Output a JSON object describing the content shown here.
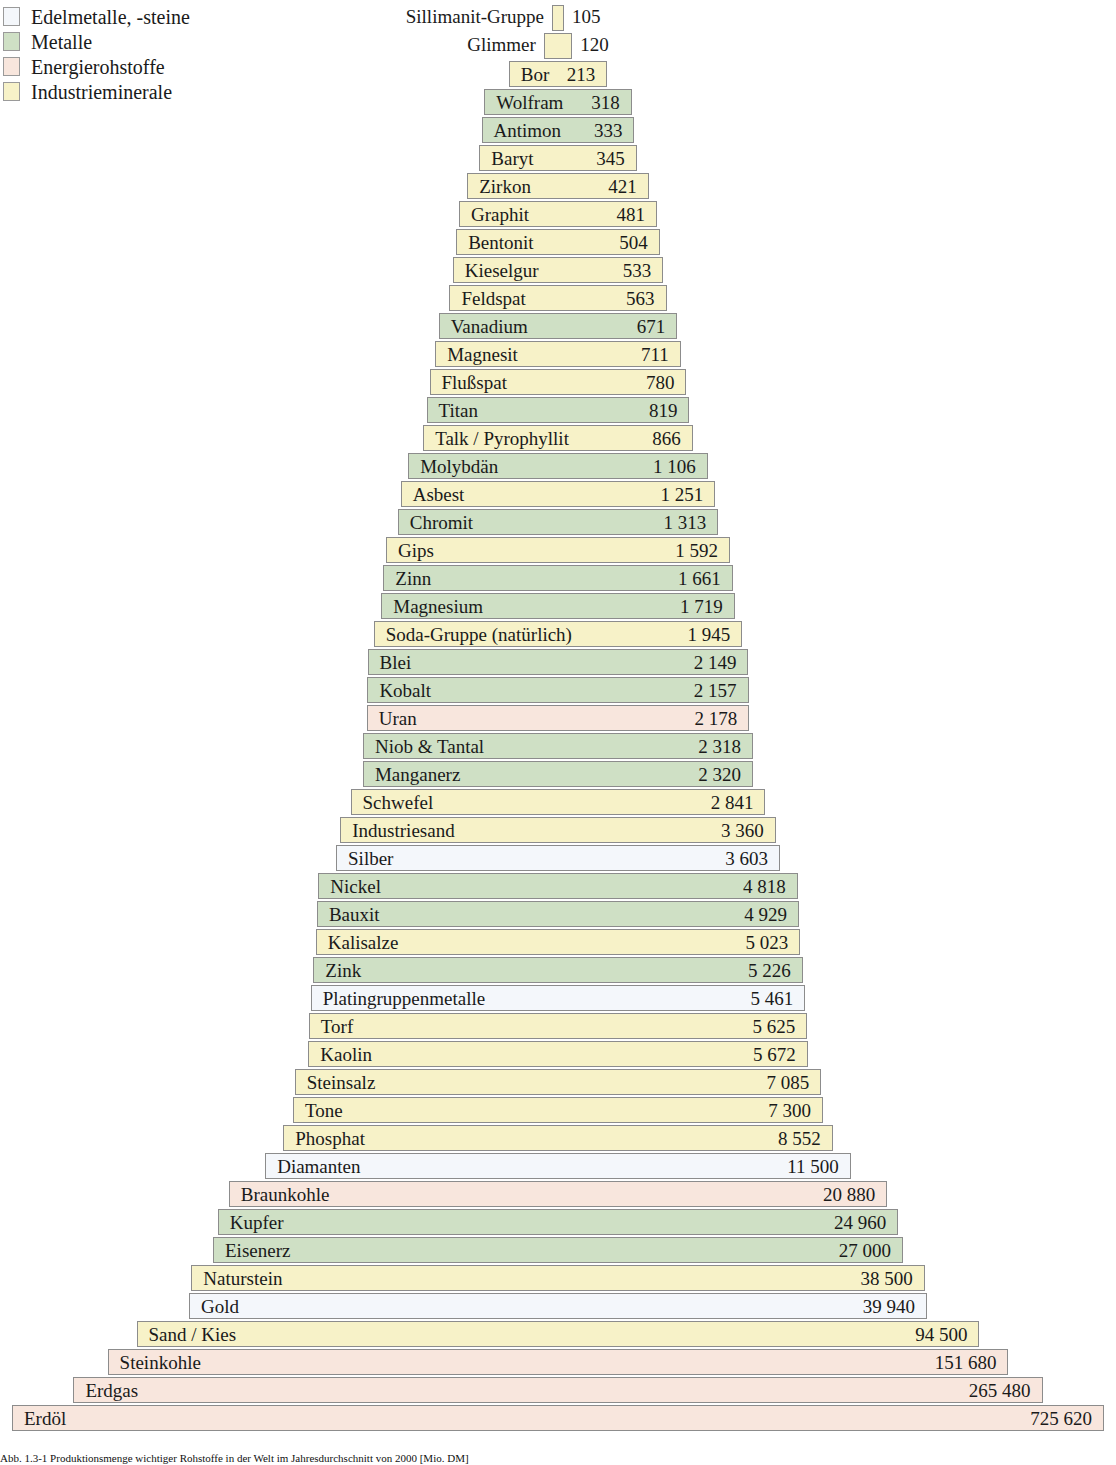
{
  "legend": {
    "items": [
      {
        "label": "Edelmetalle, -steine",
        "key": "edel",
        "color": "#f4f7fb"
      },
      {
        "label": "Metalle",
        "key": "metall",
        "color": "#cfe0c5"
      },
      {
        "label": "Energierohstoffe",
        "key": "energie",
        "color": "#f8e6dd"
      },
      {
        "label": "Industrieminerale",
        "key": "industrie",
        "color": "#f7f2c8"
      }
    ]
  },
  "caption": {
    "text": "Abb. 1.3-1  Produktionsmenge wichtiger Rohstoffe in der Welt im Jahresdurchschnitt von 2000 [Mio. DM]"
  },
  "chart_data": {
    "type": "bar",
    "xlabel": "",
    "ylabel": "",
    "orientation": "pyramid-centered-horizontal",
    "value_unit": "Mio. US-$",
    "grid": false,
    "legend_position": "top-left",
    "categories_legend": [
      "Edelmetalle, -steine",
      "Metalle",
      "Energierohstoffe",
      "Industrieminerale"
    ],
    "rows": [
      {
        "label": "Sillimanit-Gruppe",
        "value": 105,
        "value_text": "105",
        "group": "industrie",
        "outside": true
      },
      {
        "label": "Glimmer",
        "value": 120,
        "value_text": "120",
        "group": "industrie",
        "outside": true
      },
      {
        "label": "Bor",
        "value": 213,
        "value_text": "213",
        "group": "industrie",
        "outside": false
      },
      {
        "label": "Wolfram",
        "value": 318,
        "value_text": "318",
        "group": "metall",
        "outside": false
      },
      {
        "label": "Antimon",
        "value": 333,
        "value_text": "333",
        "group": "metall",
        "outside": false
      },
      {
        "label": "Baryt",
        "value": 345,
        "value_text": "345",
        "group": "industrie",
        "outside": false
      },
      {
        "label": "Zirkon",
        "value": 421,
        "value_text": "421",
        "group": "industrie",
        "outside": false
      },
      {
        "label": "Graphit",
        "value": 481,
        "value_text": "481",
        "group": "industrie",
        "outside": false
      },
      {
        "label": "Bentonit",
        "value": 504,
        "value_text": "504",
        "group": "industrie",
        "outside": false
      },
      {
        "label": "Kieselgur",
        "value": 533,
        "value_text": "533",
        "group": "industrie",
        "outside": false
      },
      {
        "label": "Feldspat",
        "value": 563,
        "value_text": "563",
        "group": "industrie",
        "outside": false
      },
      {
        "label": "Vanadium",
        "value": 671,
        "value_text": "671",
        "group": "metall",
        "outside": false
      },
      {
        "label": "Magnesit",
        "value": 711,
        "value_text": "711",
        "group": "industrie",
        "outside": false
      },
      {
        "label": "Flußspat",
        "value": 780,
        "value_text": "780",
        "group": "industrie",
        "outside": false
      },
      {
        "label": "Titan",
        "value": 819,
        "value_text": "819",
        "group": "metall",
        "outside": false
      },
      {
        "label": "Talk / Pyrophyllit",
        "value": 866,
        "value_text": "866",
        "group": "industrie",
        "outside": false
      },
      {
        "label": "Molybdän",
        "value": 1106,
        "value_text": "1 106",
        "group": "metall",
        "outside": false
      },
      {
        "label": "Asbest",
        "value": 1251,
        "value_text": "1 251",
        "group": "industrie",
        "outside": false
      },
      {
        "label": "Chromit",
        "value": 1313,
        "value_text": "1 313",
        "group": "metall",
        "outside": false
      },
      {
        "label": "Gips",
        "value": 1592,
        "value_text": "1 592",
        "group": "industrie",
        "outside": false
      },
      {
        "label": "Zinn",
        "value": 1661,
        "value_text": "1 661",
        "group": "metall",
        "outside": false
      },
      {
        "label": "Magnesium",
        "value": 1719,
        "value_text": "1 719",
        "group": "metall",
        "outside": false
      },
      {
        "label": "Soda-Gruppe (natürlich)",
        "value": 1945,
        "value_text": "1 945",
        "group": "industrie",
        "outside": false
      },
      {
        "label": "Blei",
        "value": 2149,
        "value_text": "2 149",
        "group": "metall",
        "outside": false
      },
      {
        "label": "Kobalt",
        "value": 2157,
        "value_text": "2 157",
        "group": "metall",
        "outside": false
      },
      {
        "label": "Uran",
        "value": 2178,
        "value_text": "2 178",
        "group": "energie",
        "outside": false
      },
      {
        "label": "Niob & Tantal",
        "value": 2318,
        "value_text": "2 318",
        "group": "metall",
        "outside": false
      },
      {
        "label": "Manganerz",
        "value": 2320,
        "value_text": "2 320",
        "group": "metall",
        "outside": false
      },
      {
        "label": "Schwefel",
        "value": 2841,
        "value_text": "2 841",
        "group": "industrie",
        "outside": false
      },
      {
        "label": "Industriesand",
        "value": 3360,
        "value_text": "3 360",
        "group": "industrie",
        "outside": false
      },
      {
        "label": "Silber",
        "value": 3603,
        "value_text": "3 603",
        "group": "edel",
        "outside": false
      },
      {
        "label": "Nickel",
        "value": 4818,
        "value_text": "4 818",
        "group": "metall",
        "outside": false
      },
      {
        "label": "Bauxit",
        "value": 4929,
        "value_text": "4 929",
        "group": "metall",
        "outside": false
      },
      {
        "label": "Kalisalze",
        "value": 5023,
        "value_text": "5 023",
        "group": "industrie",
        "outside": false
      },
      {
        "label": "Zink",
        "value": 5226,
        "value_text": "5 226",
        "group": "metall",
        "outside": false
      },
      {
        "label": "Platingruppenmetalle",
        "value": 5461,
        "value_text": "5 461",
        "group": "edel",
        "outside": false
      },
      {
        "label": "Torf",
        "value": 5625,
        "value_text": "5 625",
        "group": "industrie",
        "outside": false
      },
      {
        "label": "Kaolin",
        "value": 5672,
        "value_text": "5 672",
        "group": "industrie",
        "outside": false
      },
      {
        "label": "Steinsalz",
        "value": 7085,
        "value_text": "7 085",
        "group": "industrie",
        "outside": false
      },
      {
        "label": "Tone",
        "value": 7300,
        "value_text": "7 300",
        "group": "industrie",
        "outside": false
      },
      {
        "label": "Phosphat",
        "value": 8552,
        "value_text": "8 552",
        "group": "industrie",
        "outside": false
      },
      {
        "label": "Diamanten",
        "value": 11500,
        "value_text": "11 500",
        "group": "edel",
        "outside": false
      },
      {
        "label": "Braunkohle",
        "value": 20880,
        "value_text": "20 880",
        "group": "energie",
        "outside": false
      },
      {
        "label": "Kupfer",
        "value": 24960,
        "value_text": "24 960",
        "group": "metall",
        "outside": false
      },
      {
        "label": "Eisenerz",
        "value": 27000,
        "value_text": "27 000",
        "group": "metall",
        "outside": false
      },
      {
        "label": "Naturstein",
        "value": 38500,
        "value_text": "38 500",
        "group": "industrie",
        "outside": false
      },
      {
        "label": "Gold",
        "value": 39940,
        "value_text": "39 940",
        "group": "edel",
        "outside": false
      },
      {
        "label": "Sand / Kies",
        "value": 94500,
        "value_text": "94 500",
        "group": "industrie",
        "outside": false
      },
      {
        "label": "Steinkohle",
        "value": 151680,
        "value_text": "151 680",
        "group": "energie",
        "outside": false
      },
      {
        "label": "Erdgas",
        "value": 265480,
        "value_text": "265 480",
        "group": "energie",
        "outside": false
      },
      {
        "label": "Erdöl",
        "value": 725620,
        "value_text": "725 620",
        "group": "energie",
        "outside": false
      }
    ]
  }
}
